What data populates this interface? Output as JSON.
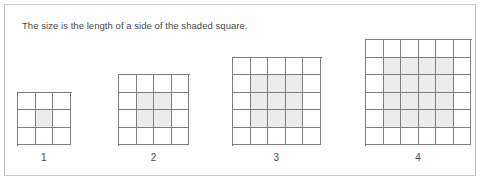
{
  "panel": {
    "caption": "The size is the length of a side of the shaded square.",
    "border_color": "#c9c9c9",
    "background_color": "#ffffff"
  },
  "colors": {
    "grid_line": "#7d7d7d",
    "shaded_cell": "#ececec",
    "empty_cell": "#ffffff",
    "text": "#4a4a4a"
  },
  "chart_data": {
    "type": "diagram",
    "title": "The size is the length of a side of the shaded square.",
    "xlabel": "",
    "ylabel": "",
    "categories": [
      "1",
      "2",
      "3",
      "4"
    ],
    "values": [
      1,
      2,
      3,
      4
    ],
    "figures": [
      {
        "label": "1",
        "grid_size": 3,
        "shaded_size": 1,
        "shaded_origin_row": 2,
        "shaded_origin_col": 2,
        "shaded_cell_count": 1,
        "left": 17,
        "cell_px": 17.5
      },
      {
        "label": "2",
        "grid_size": 4,
        "shaded_size": 2,
        "shaded_origin_row": 2,
        "shaded_origin_col": 2,
        "shaded_cell_count": 4,
        "left": 118,
        "cell_px": 17.5
      },
      {
        "label": "3",
        "grid_size": 5,
        "shaded_size": 3,
        "shaded_origin_row": 2,
        "shaded_origin_col": 2,
        "shaded_cell_count": 9,
        "left": 232,
        "cell_px": 17.5
      },
      {
        "label": "4",
        "grid_size": 6,
        "shaded_size": 4,
        "shaded_origin_row": 2,
        "shaded_origin_col": 2,
        "shaded_cell_count": 16,
        "left": 365,
        "cell_px": 17.5
      }
    ]
  }
}
